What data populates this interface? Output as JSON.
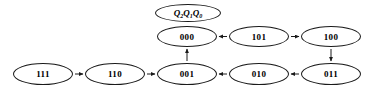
{
  "diagram": {
    "colors": {
      "stroke": "#1a1a1a",
      "fill": "#ffffff",
      "text": "#000000",
      "background": "#ffffff",
      "caption": "#d8d8d8"
    },
    "legend": {
      "label": "Q2Q1Q0",
      "q2": "Q",
      "q2sub": "2",
      "q1": "Q",
      "q1sub": "1",
      "q0": "Q",
      "q0sub": "0"
    },
    "nodes": [
      {
        "id": "legend",
        "label": "Q2Q1Q0",
        "x": 155,
        "y": 4,
        "w": 66,
        "h": 18,
        "kind": "legend"
      },
      {
        "id": "000",
        "label": "000",
        "x": 157,
        "y": 26,
        "w": 60,
        "h": 21,
        "kind": "state"
      },
      {
        "id": "101",
        "label": "101",
        "x": 229,
        "y": 26,
        "w": 60,
        "h": 21,
        "kind": "state"
      },
      {
        "id": "100",
        "label": "100",
        "x": 301,
        "y": 26,
        "w": 60,
        "h": 21,
        "kind": "state"
      },
      {
        "id": "111",
        "label": "111",
        "x": 13,
        "y": 63,
        "w": 60,
        "h": 22,
        "kind": "state"
      },
      {
        "id": "110",
        "label": "110",
        "x": 85,
        "y": 63,
        "w": 60,
        "h": 22,
        "kind": "state"
      },
      {
        "id": "001",
        "label": "001",
        "x": 157,
        "y": 63,
        "w": 60,
        "h": 22,
        "kind": "state"
      },
      {
        "id": "010",
        "label": "010",
        "x": 229,
        "y": 63,
        "w": 60,
        "h": 22,
        "kind": "state"
      },
      {
        "id": "011",
        "label": "011",
        "x": 301,
        "y": 63,
        "w": 60,
        "h": 22,
        "kind": "state"
      }
    ],
    "edges": [
      {
        "from": "111",
        "to": "110",
        "direction": "right"
      },
      {
        "from": "110",
        "to": "001",
        "direction": "right"
      },
      {
        "from": "001",
        "to": "000",
        "direction": "up"
      },
      {
        "from": "101",
        "to": "000",
        "direction": "left"
      },
      {
        "from": "101",
        "to": "100",
        "direction": "right"
      },
      {
        "from": "100",
        "to": "011",
        "direction": "down"
      },
      {
        "from": "011",
        "to": "010",
        "direction": "left"
      },
      {
        "from": "010",
        "to": "001",
        "direction": "left"
      }
    ],
    "caption": ""
  }
}
